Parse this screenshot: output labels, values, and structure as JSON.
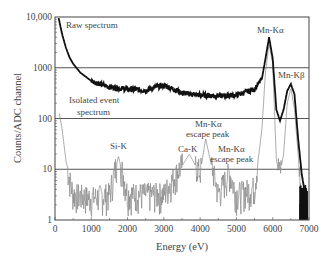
{
  "chart_data": {
    "type": "line",
    "title": "",
    "xlabel": "Energy (eV)",
    "ylabel": "Counts/ADC channel",
    "xlim": [
      0,
      7000
    ],
    "ylim": [
      1,
      10000
    ],
    "yscale": "log",
    "x_ticks": [
      "0",
      "1000",
      "2000",
      "3000",
      "4000",
      "5000",
      "6000",
      "7000"
    ],
    "y_ticks": [
      "1",
      "10",
      "100",
      "1000",
      "10,000"
    ],
    "grid": "horizontal at decades",
    "series": [
      {
        "name": "Raw spectrum",
        "style": "thick black",
        "x": [
          100,
          200,
          300,
          400,
          500,
          700,
          1000,
          1500,
          2000,
          2500,
          2800,
          3000,
          3200,
          3500,
          4000,
          4500,
          5000,
          5500,
          5700,
          5800,
          5900,
          6000,
          6100,
          6200,
          6300,
          6400,
          6500,
          6600,
          6700,
          6800,
          6900
        ],
        "values": [
          9500,
          4500,
          2500,
          1600,
          1200,
          800,
          550,
          420,
          380,
          360,
          420,
          450,
          400,
          320,
          290,
          280,
          290,
          380,
          600,
          1500,
          4000,
          1500,
          150,
          90,
          150,
          350,
          480,
          300,
          40,
          8,
          3
        ]
      },
      {
        "name": "Isolated event spectrum",
        "style": "thin grey, noisy",
        "x": [
          100,
          200,
          300,
          400,
          500,
          1000,
          1500,
          1750,
          2000,
          3000,
          3700,
          4000,
          4150,
          4500,
          4800,
          5000,
          5500,
          5700,
          5800,
          5900,
          6000,
          6100,
          6200,
          6300,
          6400,
          6500,
          6600,
          6700,
          6800
        ],
        "values": [
          150,
          60,
          15,
          6,
          3,
          2.5,
          3,
          18,
          3,
          3,
          20,
          8,
          40,
          3,
          8,
          3,
          4,
          60,
          800,
          3000,
          1200,
          15,
          8,
          20,
          200,
          400,
          150,
          20,
          2
        ]
      }
    ],
    "annotations": [
      {
        "text": "Raw spectrum",
        "x": 300,
        "y": 8000
      },
      {
        "text": "Isolated event spectrum",
        "x": 500,
        "y": 200
      },
      {
        "text": "Si-K",
        "x": 1750,
        "y": 30
      },
      {
        "text": "Ca-K",
        "x": 3700,
        "y": 30
      },
      {
        "text": "Mn-Kα escape peak",
        "x": 4150,
        "y": 70
      },
      {
        "text": "Mn-Kα escape peak",
        "x": 5000,
        "y": 25
      },
      {
        "text": "Mn-Kα",
        "x": 5900,
        "y": 6000
      },
      {
        "text": "Mn-Kβ",
        "x": 6500,
        "y": 800
      }
    ]
  },
  "labels": {
    "xlabel": "Energy (eV)",
    "ylabel": "Counts/ADC channel",
    "raw": "Raw spectrum",
    "iso1": "Isolated event",
    "iso2": "spectrum",
    "sik": "Si-K",
    "cak": "Ca-K",
    "esc1a": "Mn-Kα",
    "esc1b": "escape peak",
    "esc2a": "Mn-Kα",
    "esc2b": "escape peak",
    "mnka": "Mn-Kα",
    "mnkb": "Mn-Kβ"
  }
}
